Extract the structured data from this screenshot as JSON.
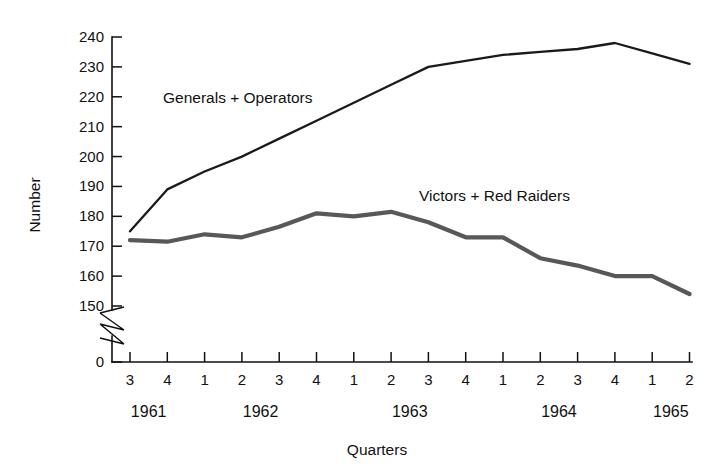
{
  "chart_data": {
    "type": "line",
    "title": "",
    "xlabel": "Quarters",
    "ylabel": "Number",
    "ylim": [
      150,
      240
    ],
    "y_axis_zero_shown": true,
    "y_axis_break": true,
    "y_ticks": [
      240,
      230,
      220,
      210,
      200,
      190,
      180,
      170,
      160,
      150
    ],
    "y_zero_tick": "0",
    "grid": false,
    "legend_position": "inline-annotation",
    "categories": [
      "3",
      "4",
      "1",
      "2",
      "3",
      "4",
      "1",
      "2",
      "3",
      "4",
      "1",
      "2",
      "3",
      "4",
      "1",
      "2"
    ],
    "x_group_labels": [
      "1961",
      "1962",
      "1963",
      "1964",
      "1965"
    ],
    "x_group_spans": [
      2,
      4,
      4,
      4,
      2
    ],
    "x_axis_domain": [
      "1961 Q3",
      "1965 Q2"
    ],
    "series": [
      {
        "name": "Generals + Operators",
        "color": "#1a1a1a",
        "values": [
          175,
          189,
          195,
          200,
          206,
          212,
          218,
          224,
          230,
          232,
          234,
          235,
          236,
          238,
          234.5,
          231
        ]
      },
      {
        "name": "Victors + Red Raiders",
        "color": "#58585a",
        "values": [
          172,
          171.5,
          174,
          173,
          176.5,
          181,
          180,
          181.5,
          178,
          173,
          173,
          166,
          163.5,
          160,
          160,
          154
        ]
      }
    ],
    "annotations": [
      {
        "name": "generals-operators-label",
        "text": "Generals + Operators",
        "x_px": 163,
        "y_px": 103
      },
      {
        "name": "victors-red-raiders-label",
        "text": "Victors + Red Raiders",
        "x_px": 419,
        "y_px": 201
      }
    ]
  },
  "axis": {
    "y_title": "Number",
    "x_title": "Quarters"
  },
  "colors": {
    "background": "#ffffff",
    "axis": "#111111",
    "series_primary": "#1a1a1a",
    "series_secondary": "#58585a"
  }
}
